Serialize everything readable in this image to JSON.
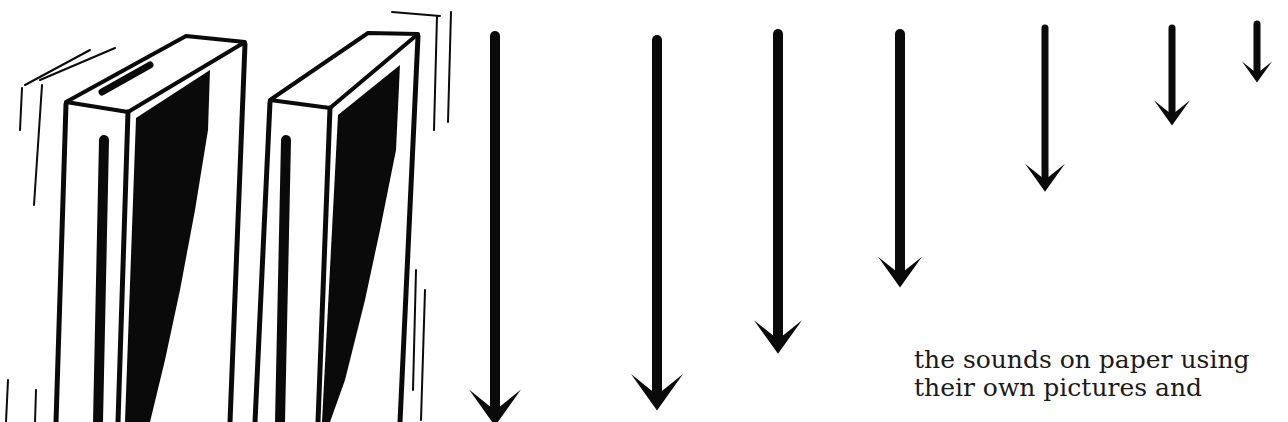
{
  "page": {
    "type": "scanned book page illustration",
    "ink_color": "#0a0a0a",
    "paper_color": "#ffffff"
  },
  "illustration": {
    "subject": "two tall boxes with descending arrows",
    "boxes": [
      {
        "name": "left-box",
        "shaded_side": true
      },
      {
        "name": "right-box",
        "shaded_side": true
      }
    ],
    "arrows": {
      "direction": "down",
      "count": 7,
      "relative_lengths": [
        1.0,
        0.95,
        0.82,
        0.65,
        0.42,
        0.25,
        0.15
      ]
    }
  },
  "caption": {
    "lines": [
      "the sounds on paper using",
      "their own pictures and"
    ]
  }
}
